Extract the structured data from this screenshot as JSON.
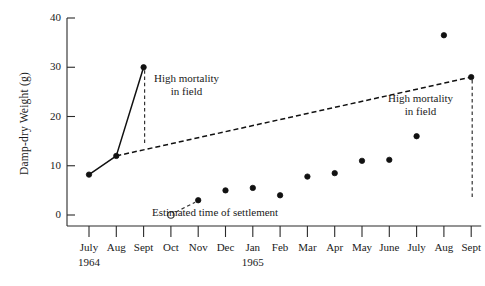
{
  "chart_data": {
    "type": "line",
    "title": "",
    "subtitle": "",
    "xlabel": "",
    "ylabel": "Damp-dry Weight (g)",
    "ylim": [
      0,
      40
    ],
    "yticks": [
      0,
      10,
      20,
      30,
      40
    ],
    "ytick_labels": [
      "0",
      "10",
      "20",
      "30",
      "40"
    ],
    "grid": false,
    "legend": "none",
    "categories": [
      "July",
      "Aug",
      "Sept",
      "Oct",
      "Nov",
      "Dec",
      "Jan",
      "Feb",
      "Mar",
      "Apr",
      "May",
      "June",
      "July",
      "Aug",
      "Sept"
    ],
    "year_labels": [
      {
        "text": "1964",
        "category": "July"
      },
      {
        "text": "1965",
        "category": "Jan"
      }
    ],
    "series": [
      {
        "name": "Damp-dry weight",
        "values": [
          8.2,
          12.0,
          30.0,
          null,
          3.0,
          5.0,
          5.5,
          4.0,
          7.8,
          8.5,
          11.0,
          11.2,
          16.0,
          36.5,
          28.0
        ],
        "marker": "filled-circle",
        "line_style": "solid"
      }
    ],
    "extra_points": [
      {
        "name": "estimated-settlement-point",
        "category": "Oct",
        "value": 0.0,
        "marker": "open-circle",
        "connector": "dashed-to-next"
      }
    ],
    "dashed_segments": [
      {
        "from_category": "Aug",
        "to_category": "Sept",
        "note": "decline after July 1965 peak"
      }
    ],
    "annotations": [
      {
        "name": "high-mortality-1964",
        "lines": [
          "High mortality",
          "in  field"
        ],
        "anchor_category": "Sept",
        "anchor_value": 30.0,
        "drop_to_value": 14.5,
        "marker_line": "dashed-vertical"
      },
      {
        "name": "estimated-settlement",
        "lines": [
          "Estimated time of settlement"
        ],
        "anchor_category": "Oct",
        "anchor_value": 0.0,
        "marker_line": "dashed-lead"
      },
      {
        "name": "high-mortality-1965",
        "lines": [
          "High mortality",
          "in  field"
        ],
        "anchor_category": "Sept",
        "anchor_value": 28.0,
        "drop_to_value": 3.5,
        "marker_line": "dashed-vertical"
      }
    ],
    "colors": {
      "line": "#111111",
      "marker_fill": "#111111",
      "marker_open_fill": "#ffffff",
      "axis": "#2a2a2a",
      "text": "#1a1a1a",
      "background": "#ffffff"
    }
  }
}
